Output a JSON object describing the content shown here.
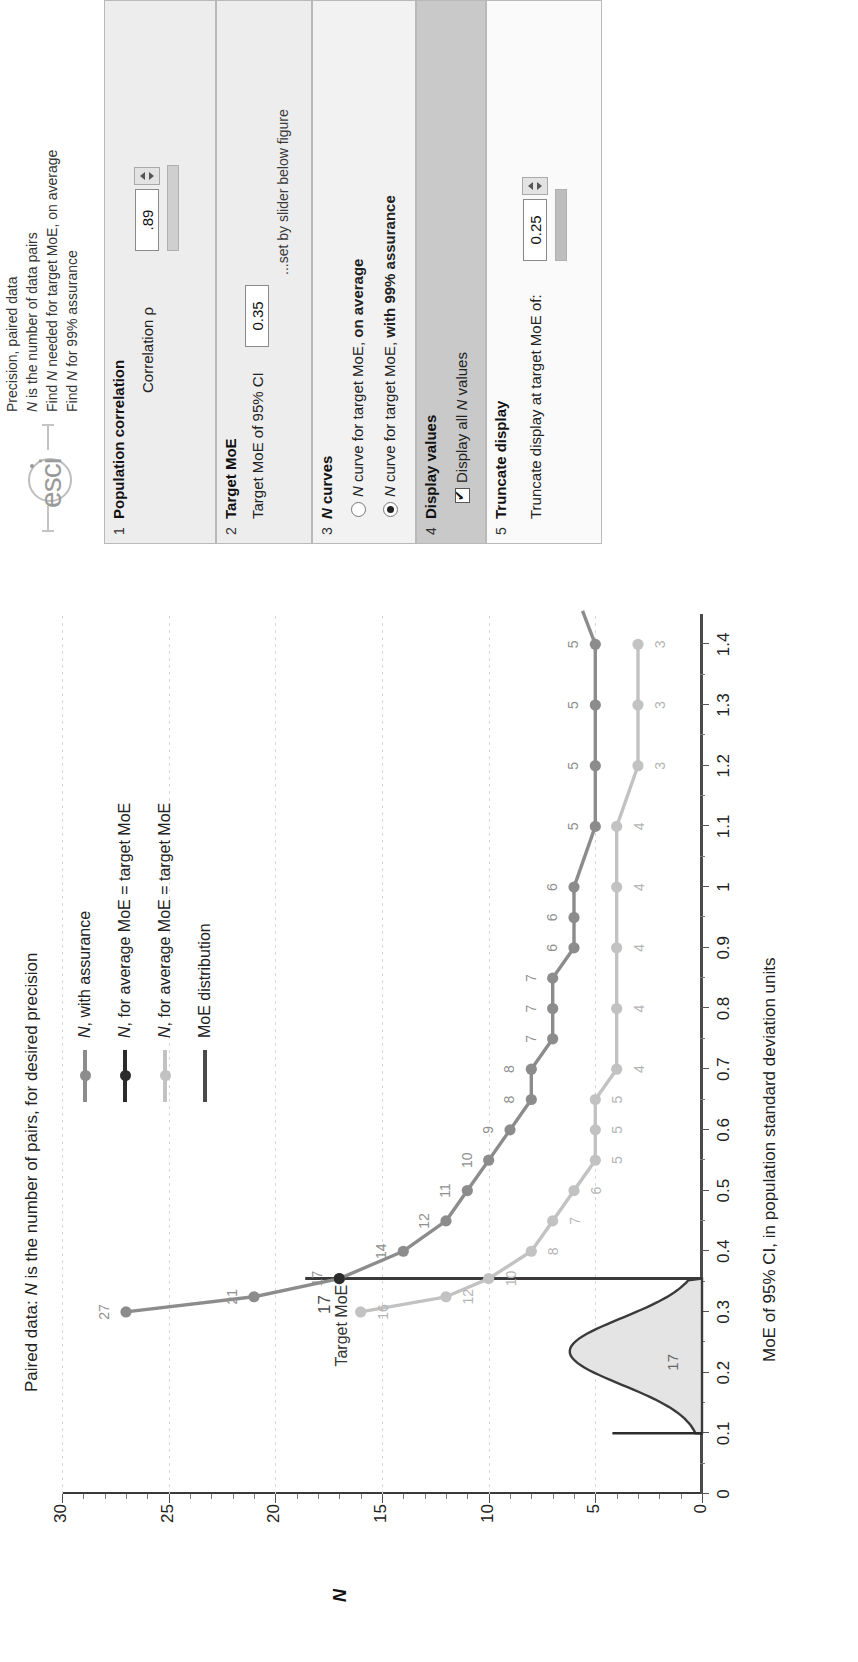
{
  "header": {
    "logo_text": "esci",
    "lines": [
      "Precision, paired data",
      "N is the number of data pairs",
      "Find N needed for target MoE, on average",
      "Find N for 99% assurance"
    ]
  },
  "chart_data": {
    "type": "line",
    "title": "Paired data: N is the number of pairs, for desired precision",
    "xlabel": "MoE of 95% CI, in population standard deviation units",
    "ylabel": "N",
    "xlim": [
      0,
      1.45
    ],
    "ylim": [
      0,
      30
    ],
    "xticks": [
      "0",
      "0.1",
      "0.2",
      "0.3",
      "0.4",
      "0.5",
      "0.6",
      "0.7",
      "0.8",
      "0.9",
      "1",
      "1.1",
      "1.2",
      "1.3",
      "1.4"
    ],
    "yticks": [
      "0",
      "5",
      "10",
      "15",
      "20",
      "25",
      "30"
    ],
    "grid": true,
    "legend_position": "top-right",
    "annotations": [
      {
        "text": "Target MoE",
        "x": 0.355,
        "y": 17
      },
      {
        "text": "17",
        "x": 0.235,
        "y": 2
      }
    ],
    "target_moe": 0.35,
    "series": [
      {
        "name": "N, with assurance",
        "color": "#8c8c8c",
        "x": [
          0.3,
          0.325,
          0.355,
          0.4,
          0.45,
          0.5,
          0.55,
          0.6,
          0.65,
          0.7,
          0.75,
          0.8,
          0.85,
          0.9,
          0.95,
          1.0,
          1.1,
          1.2,
          1.3,
          1.4
        ],
        "values": [
          27,
          21,
          17,
          14,
          12,
          11,
          10,
          9,
          8,
          8,
          7,
          7,
          7,
          6,
          6,
          6,
          5,
          5,
          5,
          5
        ],
        "labels": [
          "27",
          "21",
          "17",
          "14",
          "12",
          "11",
          "10",
          "9",
          "8",
          "8",
          "7",
          "7",
          "7",
          "6",
          "6",
          "6",
          "5",
          "5",
          "5",
          "5"
        ]
      },
      {
        "name": "N, for average MoE = target MoE",
        "color": "#2b2b2b",
        "x": [
          0.355
        ],
        "values": [
          17
        ],
        "labels": [
          "17"
        ]
      },
      {
        "name": "N, for average MoE = target MoE",
        "color": "#c2c2c2",
        "x": [
          0.3,
          0.325,
          0.355,
          0.4,
          0.45,
          0.5,
          0.55,
          0.6,
          0.65,
          0.7,
          0.8,
          0.9,
          1.0,
          1.1,
          1.2,
          1.3,
          1.4
        ],
        "values": [
          16,
          12,
          10,
          8,
          7,
          6,
          5,
          5,
          5,
          4,
          4,
          4,
          4,
          4,
          3,
          3,
          3
        ],
        "labels": [
          "16",
          "12",
          "10",
          "8",
          "7",
          "6",
          "5",
          "5",
          "5",
          "4",
          "4",
          "4",
          "4",
          "4",
          "3",
          "3",
          "3"
        ]
      },
      {
        "name": "MoE distribution",
        "color": "#4a4a4a",
        "type": "density",
        "peak_x": 0.235,
        "range_x": [
          0.1,
          0.355
        ],
        "label": "17"
      }
    ]
  },
  "panels": [
    {
      "num": "1",
      "title": "Population correlation",
      "label": "Correlation ρ",
      "value": ".89"
    },
    {
      "num": "2",
      "title": "Target MoE",
      "label": "Target MoE of 95% CI",
      "value": "0.35",
      "hint": "...set by slider below figure"
    },
    {
      "num": "3",
      "title": "N curves",
      "options": [
        {
          "label_prefix": "N",
          "label": " curve for target MoE, ",
          "label_bold": "on average",
          "selected": false
        },
        {
          "label_prefix": "N",
          "label": " curve for target MoE, ",
          "label_bold": "with 99% assurance",
          "selected": true
        }
      ]
    },
    {
      "num": "4",
      "title": "Display values",
      "checkbox_label": "Display all N values",
      "checked": true
    },
    {
      "num": "5",
      "title": "Truncate display",
      "label": "Truncate display at target MoE of:",
      "value": "0.25"
    }
  ]
}
